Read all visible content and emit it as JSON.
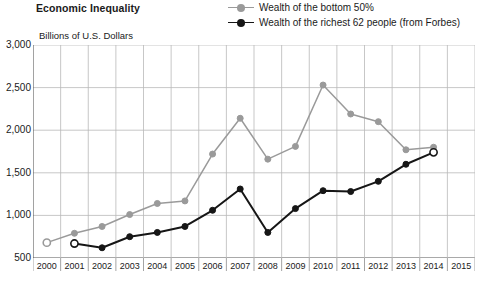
{
  "title": "Economic Inequality",
  "ylabel": "Billions of U.S. Dollars",
  "legend": [
    {
      "label": "Wealth of the bottom 50%",
      "color": "#9a9a9a",
      "marker": "legend-marker-gray"
    },
    {
      "label": "Wealth of the richest 62 people (from Forbes)",
      "color": "#161616",
      "marker": "legend-marker-black"
    }
  ],
  "chart_data": {
    "type": "line",
    "title": "Economic Inequality",
    "xlabel": "",
    "ylabel": "Billions of U.S. Dollars",
    "ylim": [
      500,
      3000
    ],
    "yticks": [
      500,
      1000,
      1500,
      2000,
      2500,
      3000
    ],
    "ytick_labels": [
      "500",
      "1,000",
      "1,500",
      "2,000",
      "2,500",
      "3,000"
    ],
    "xlim": [
      2000,
      2015
    ],
    "x": [
      2000,
      2001,
      2002,
      2003,
      2004,
      2005,
      2006,
      2007,
      2008,
      2009,
      2010,
      2011,
      2012,
      2013,
      2014,
      2015
    ],
    "xtick_labels": [
      "2000",
      "2001",
      "2002",
      "2003",
      "2004",
      "2005",
      "2006",
      "2007",
      "2008",
      "2009",
      "2010",
      "2011",
      "2012",
      "2013",
      "2014",
      "2015"
    ],
    "grid": true,
    "legend_position": "top-right",
    "series": [
      {
        "name": "Wealth of the bottom 50%",
        "color": "#9a9a9a",
        "x": [
          2000,
          2001,
          2002,
          2003,
          2004,
          2005,
          2006,
          2007,
          2008,
          2009,
          2010,
          2011,
          2012,
          2013,
          2014
        ],
        "values": [
          680,
          790,
          870,
          1010,
          1140,
          1170,
          1720,
          2140,
          1660,
          1810,
          2530,
          2190,
          2100,
          1770,
          1800
        ],
        "open_markers": [
          2000
        ]
      },
      {
        "name": "Wealth of the richest 62 people (from Forbes)",
        "color": "#161616",
        "x": [
          2001,
          2002,
          2003,
          2004,
          2005,
          2006,
          2007,
          2008,
          2009,
          2010,
          2011,
          2012,
          2013,
          2014
        ],
        "values": [
          670,
          620,
          750,
          800,
          870,
          1060,
          1310,
          800,
          1080,
          1290,
          1280,
          1400,
          1600,
          1740
        ],
        "open_markers": [
          2001,
          2014
        ]
      }
    ],
    "series_connector": {
      "note": "gray series ends 2014 at 1750 with open marker",
      "gray_end_value": 1750
    }
  }
}
